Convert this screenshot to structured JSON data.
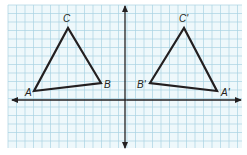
{
  "diagram": {
    "type": "coordinate-grid-reflection",
    "colors": {
      "background": "#ffffff",
      "grid_fill": "#eef8fb",
      "grid_line": "#a9d3e2",
      "axis": "#231f20",
      "triangle": "#231f20"
    },
    "grid": {
      "x0": 8,
      "y0": 5,
      "x1": 242,
      "y1": 148,
      "step": 8.5
    },
    "axes": {
      "x_axis": {
        "y": 100,
        "x_start": 12,
        "x_end": 241,
        "arrows": "both"
      },
      "y_axis": {
        "x": 125,
        "y_start": 6,
        "y_end": 148,
        "arrows": "both"
      }
    },
    "triangles": [
      {
        "name": "ABC",
        "vertices": [
          {
            "label": "A",
            "x": 34,
            "y": 91,
            "label_x": 25,
            "label_y": 96
          },
          {
            "label": "B",
            "x": 101,
            "y": 83,
            "label_x": 104,
            "label_y": 88
          },
          {
            "label": "C",
            "x": 68,
            "y": 28,
            "label_x": 63,
            "label_y": 22
          }
        ]
      },
      {
        "name": "A'B'C'",
        "vertices": [
          {
            "label": "A'",
            "x": 217,
            "y": 91,
            "label_x": 221,
            "label_y": 96
          },
          {
            "label": "B'",
            "x": 150,
            "y": 83,
            "label_x": 137,
            "label_y": 88
          },
          {
            "label": "C'",
            "x": 184,
            "y": 28,
            "label_x": 179,
            "label_y": 22
          }
        ]
      }
    ]
  }
}
